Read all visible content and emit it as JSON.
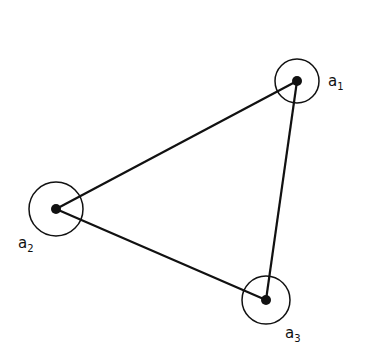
{
  "diagram": {
    "type": "triangle-graph",
    "nodes": [
      {
        "id": "a1",
        "label": "a",
        "sub": "1",
        "cx": 297,
        "cy": 81,
        "r": 22,
        "lx": 328,
        "ly": 86
      },
      {
        "id": "a2",
        "label": "a",
        "sub": "2",
        "cx": 56,
        "cy": 209,
        "r": 27,
        "lx": 18,
        "ly": 248
      },
      {
        "id": "a3",
        "label": "a",
        "sub": "3",
        "cx": 266,
        "cy": 300,
        "r": 24,
        "lx": 285,
        "ly": 338
      }
    ],
    "edges": [
      [
        "a1",
        "a2"
      ],
      [
        "a2",
        "a3"
      ],
      [
        "a3",
        "a1"
      ]
    ],
    "colors": {
      "stroke": "#111111",
      "background": "#ffffff"
    }
  }
}
